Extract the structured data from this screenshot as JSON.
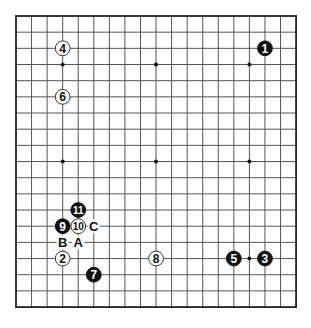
{
  "board": {
    "size": 19,
    "origin_x": 16,
    "origin_y": 16,
    "spacing_x": 15.56,
    "spacing_y": 16.17,
    "line_color": "#555555",
    "border_color": "#222222",
    "background": "#ffffff"
  },
  "star_points": [
    {
      "col": 3,
      "row": 3
    },
    {
      "col": 9,
      "row": 3
    },
    {
      "col": 15,
      "row": 3
    },
    {
      "col": 3,
      "row": 9
    },
    {
      "col": 9,
      "row": 9
    },
    {
      "col": 15,
      "row": 9
    },
    {
      "col": 3,
      "row": 15
    },
    {
      "col": 9,
      "row": 15
    },
    {
      "col": 15,
      "row": 15
    }
  ],
  "stones": [
    {
      "move": "1",
      "color": "black",
      "col": 16,
      "row": 2
    },
    {
      "move": "2",
      "color": "white",
      "col": 3,
      "row": 15
    },
    {
      "move": "3",
      "color": "black",
      "col": 16,
      "row": 15
    },
    {
      "move": "4",
      "color": "white",
      "col": 3,
      "row": 2
    },
    {
      "move": "5",
      "color": "black",
      "col": 14,
      "row": 15
    },
    {
      "move": "6",
      "color": "white",
      "col": 3,
      "row": 5
    },
    {
      "move": "7",
      "color": "black",
      "col": 5,
      "row": 16
    },
    {
      "move": "8",
      "color": "white",
      "col": 9,
      "row": 15
    },
    {
      "move": "9",
      "color": "black",
      "col": 3,
      "row": 13
    },
    {
      "move": "10",
      "color": "white",
      "col": 4,
      "row": 13
    },
    {
      "move": "11",
      "color": "black",
      "col": 4,
      "row": 12
    }
  ],
  "markers": [
    {
      "label": "A",
      "col": 4,
      "row": 14
    },
    {
      "label": "B",
      "col": 3,
      "row": 14
    },
    {
      "label": "C",
      "col": 5,
      "row": 13
    }
  ]
}
